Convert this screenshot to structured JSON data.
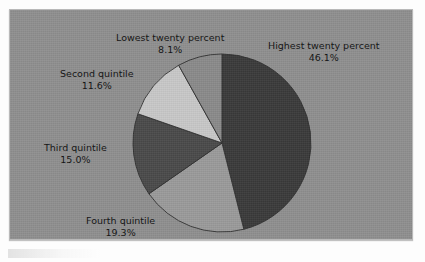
{
  "chart_data": {
    "type": "pie",
    "title": "",
    "subtitle": "",
    "xlabel": "",
    "ylabel": "",
    "legend_position": "none",
    "grid": false,
    "units": "percent",
    "start_angle_deg": 0,
    "direction": "clockwise",
    "categories": [
      "Highest twenty percent",
      "Fourth quintile",
      "Third quintile",
      "Second quintile",
      "Lowest twenty percent"
    ],
    "values": [
      46.1,
      19.3,
      15.0,
      11.6,
      8.1
    ],
    "slices": [
      {
        "label": "Highest twenty percent",
        "value": 46.1,
        "value_text": "46.1%",
        "color": "#3a3a3a",
        "start_deg": 0,
        "end_deg": 165.96
      },
      {
        "label": "Fourth quintile",
        "value": 19.3,
        "value_text": "19.3%",
        "color": "#9a9a9a",
        "start_deg": 165.96,
        "end_deg": 235.44
      },
      {
        "label": "Third quintile",
        "value": 15.0,
        "value_text": "15.0%",
        "color": "#4a4a4a",
        "start_deg": 235.44,
        "end_deg": 289.44
      },
      {
        "label": "Second quintile",
        "value": 11.6,
        "value_text": "11.6%",
        "color": "#c8c8c8",
        "start_deg": 289.44,
        "end_deg": 331.2
      },
      {
        "label": "Lowest twenty percent",
        "value": 8.1,
        "value_text": "8.1%",
        "color": "#8a8a8a",
        "start_deg": 331.2,
        "end_deg": 360
      }
    ]
  },
  "labels": {
    "highest": {
      "name": "Highest twenty percent",
      "value": "46.1%"
    },
    "fourth": {
      "name": "Fourth quintile",
      "value": "19.3%"
    },
    "third": {
      "name": "Third quintile",
      "value": "15.0%"
    },
    "second": {
      "name": "Second quintile",
      "value": "11.6%"
    },
    "lowest": {
      "name": "Lowest twenty percent",
      "value": "8.1%"
    }
  },
  "colors": {
    "plot_background": "#8f8f8f",
    "frame_border": "#b9b9b9",
    "page_background": "#fdfdfd",
    "label_text": "#151515",
    "slice_outline": "#2f2f2f"
  }
}
